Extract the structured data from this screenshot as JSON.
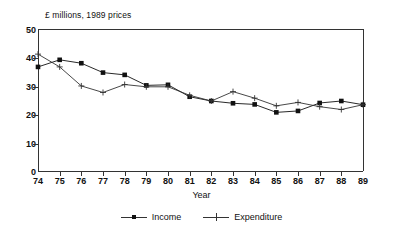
{
  "chart_data": {
    "type": "line",
    "title": "£ millions, 1989 prices",
    "xlabel": "Year",
    "ylabel": "",
    "categories": [
      "74",
      "75",
      "76",
      "77",
      "78",
      "79",
      "80",
      "81",
      "82",
      "83",
      "84",
      "85",
      "86",
      "87",
      "88",
      "89"
    ],
    "xtick_labels": [
      "74",
      "75",
      "76",
      "77",
      "78",
      "79",
      "80",
      "81",
      "82",
      "83",
      "84",
      "85",
      "86",
      "87",
      "88",
      "89"
    ],
    "ytick_labels": [
      "0",
      "10",
      "20",
      "30",
      "40",
      "50"
    ],
    "yticks": [
      0,
      10,
      20,
      30,
      40,
      50
    ],
    "ylim": [
      0,
      50
    ],
    "grid": false,
    "legend_position": "bottom-center",
    "series": [
      {
        "name": "Income",
        "marker": "filled-square",
        "color": "#111111",
        "values": [
          37.0,
          39.5,
          38.3,
          35.0,
          34.2,
          30.5,
          30.7,
          26.5,
          25.0,
          24.2,
          23.8,
          21.0,
          21.5,
          24.3,
          25.0,
          23.7
        ]
      },
      {
        "name": "Expenditure",
        "marker": "plus",
        "color": "#333333",
        "values": [
          41.5,
          37.0,
          30.3,
          28.0,
          30.8,
          30.0,
          30.0,
          27.0,
          25.0,
          28.3,
          26.0,
          23.3,
          24.5,
          23.0,
          22.0,
          23.7
        ]
      }
    ]
  },
  "legend": {
    "income_label": "Income",
    "expenditure_label": "Expenditure"
  }
}
